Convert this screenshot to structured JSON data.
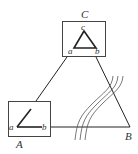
{
  "diagram": {
    "vertices": {
      "A": {
        "label": "A"
      },
      "B": {
        "label": "B"
      },
      "C": {
        "label": "C"
      }
    },
    "box_A": {
      "corner_labels": {
        "a": "a",
        "b": "b"
      }
    },
    "box_C": {
      "corner_labels": {
        "a": "a",
        "b": "b",
        "c": "c"
      }
    },
    "wavy_lines": {
      "count": 3
    },
    "colors": {
      "stroke": "#222222",
      "label": "#333333",
      "background": "#ffffff"
    }
  }
}
